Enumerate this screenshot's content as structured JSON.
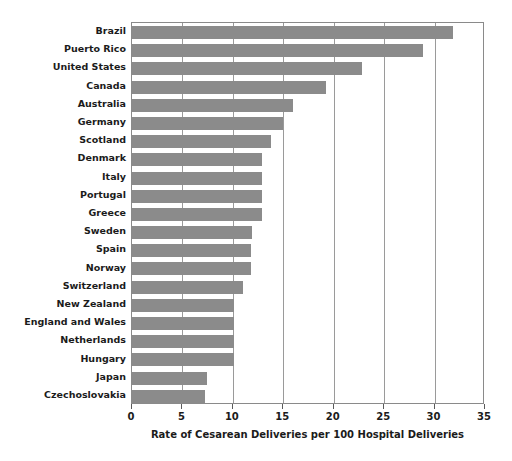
{
  "chart_data": {
    "type": "bar",
    "orientation": "horizontal",
    "title": "",
    "xlabel": "Rate of Cesarean Deliveries per 100 Hospital Deliveries",
    "ylabel": "",
    "xlim": [
      0,
      35
    ],
    "xticks": [
      0,
      5,
      10,
      15,
      20,
      25,
      30,
      35
    ],
    "xtick_labels": [
      "0",
      "5",
      "10",
      "15",
      "20",
      "25",
      "30",
      "35"
    ],
    "grid": true,
    "grid_axis": "x",
    "legend": false,
    "bar_color": "#8b8b8b",
    "frame_color": "#8a8a8a",
    "categories": [
      "Brazil",
      "Puerto Rico",
      "United States",
      "Canada",
      "Australia",
      "Germany",
      "Scotland",
      "Denmark",
      "Italy",
      "Portugal",
      "Greece",
      "Sweden",
      "Spain",
      "Norway",
      "Switzerland",
      "New Zealand",
      "England and Wales",
      "Netherlands",
      "Hungary",
      "Japan",
      "Czechoslovakia"
    ],
    "values": [
      31.8,
      28.9,
      22.8,
      19.2,
      16.0,
      15.0,
      13.8,
      12.9,
      12.9,
      12.9,
      12.9,
      11.9,
      11.8,
      11.8,
      11.0,
      10.1,
      10.1,
      10.1,
      10.1,
      7.4,
      7.2
    ]
  }
}
